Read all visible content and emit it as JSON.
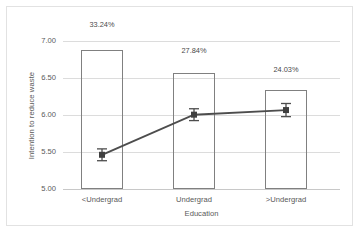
{
  "chart_data": {
    "type": "bar",
    "title": "",
    "xlabel": "Education",
    "ylabel": "Intention to reduce waste",
    "categories": [
      "<Undergrad",
      "Undergrad",
      ">Undergrad"
    ],
    "ylim": [
      5.0,
      7.25
    ],
    "yticks": [
      "5.00",
      "5.50",
      "6.00",
      "6.50",
      "7.00"
    ],
    "ytick_values": [
      5.0,
      5.5,
      6.0,
      6.5,
      7.0
    ],
    "grid": true,
    "legend": "none",
    "series": [
      {
        "name": "Percentage of sample",
        "type": "bar",
        "values": [
          7.12,
          6.77,
          6.51
        ],
        "data_labels": [
          "33.24%",
          "27.84%",
          "24.03%"
        ],
        "percent_values": [
          33.24,
          27.84,
          24.03
        ]
      },
      {
        "name": "Mean intention to reduce waste",
        "type": "line",
        "values": [
          5.52,
          6.13,
          6.2
        ],
        "error_bars": [
          0.09,
          0.09,
          0.1
        ]
      }
    ],
    "colors": {
      "bar_outline": "#808080",
      "bar_fill": "#ffffff",
      "line": "#4d4d4d",
      "marker": "#3f3f3f",
      "error_bar": "#4d4d4d",
      "gridline": "#dcdcdc",
      "text": "#595959",
      "frame": "#e2e2e2"
    }
  }
}
